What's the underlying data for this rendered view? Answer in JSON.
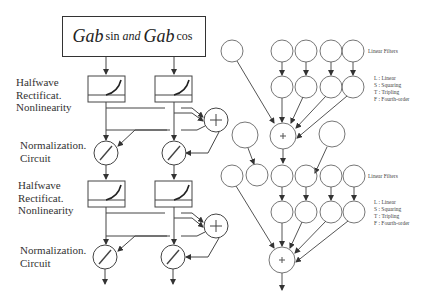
{
  "left_diagram": {
    "title": {
      "gab1": "Gab",
      "sin": "sin",
      "and": "and",
      "gab2": "Gab",
      "cos": "cos"
    },
    "stages": [
      {
        "label_lines": [
          "Halfwave",
          "Rectificat.",
          "Nonlinearity"
        ]
      },
      {
        "label_lines": [
          "Normalization.",
          "Circuit"
        ]
      },
      {
        "label_lines": [
          "Halfwave",
          "Rectificat.",
          "Nonlinearity"
        ]
      },
      {
        "label_lines": [
          "Normalization.",
          "Circuit"
        ]
      }
    ],
    "sum_symbol": "+",
    "norm_symbol": "/"
  },
  "right_diagram": {
    "panels": [
      {
        "filters_label": "Linear Filters",
        "legend": [
          "L : Linear",
          "S : Squaring",
          "T : Tripling",
          "F : Fourth-order"
        ],
        "sum_symbol": "+"
      },
      {
        "filters_label": "Linear Filters",
        "legend": [
          "L : Linear",
          "S : Squaring",
          "T : Tripling",
          "F : Fourth-order"
        ],
        "sum_symbol": "+"
      }
    ]
  },
  "colors": {
    "stroke": "#444444",
    "text": "#333333",
    "background": "#ffffff"
  }
}
